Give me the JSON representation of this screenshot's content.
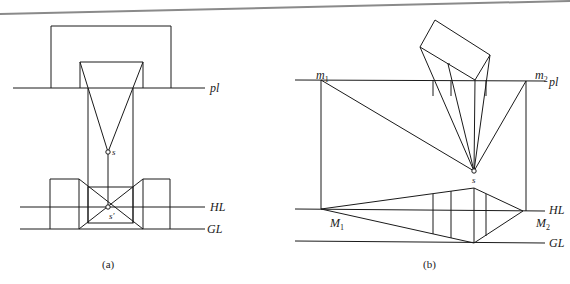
{
  "figure_a": {
    "caption": "(a)",
    "labels": {
      "picture_plane": "pl",
      "station_point": "s",
      "station_point_prime": "s′",
      "horizon_line": "HL",
      "ground_line": "GL"
    }
  },
  "figure_b": {
    "caption": "(b)",
    "labels": {
      "measuring_point_1_plan": "m",
      "measuring_point_1_plan_sub": "1",
      "measuring_point_2_plan": "m",
      "measuring_point_2_plan_sub": "2",
      "picture_plane": "pl",
      "station_point": "s",
      "measuring_point_1": "M",
      "measuring_point_1_sub": "1",
      "measuring_point_2": "M",
      "measuring_point_2_sub": "2",
      "horizon_line": "HL",
      "ground_line": "GL"
    }
  },
  "colors": {
    "line": "#1a1a1a",
    "top_rule": "#8a8a8a",
    "background": "#ffffff"
  }
}
